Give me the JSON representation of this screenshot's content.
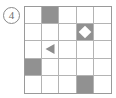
{
  "figure": {
    "item_number": "4",
    "item_number_style": "circled",
    "grid": {
      "rows": 5,
      "columns": 5,
      "border_color": "#9a9a9a",
      "line_color": "#b4b4b4",
      "cell_background": "#ffffff",
      "fill_color": "#919191",
      "cells": [
        [
          {
            "fill": "none",
            "mark": "none"
          },
          {
            "fill": "gray",
            "mark": "none"
          },
          {
            "fill": "none",
            "mark": "none"
          },
          {
            "fill": "none",
            "mark": "none"
          },
          {
            "fill": "none",
            "mark": "none"
          }
        ],
        [
          {
            "fill": "none",
            "mark": "none"
          },
          {
            "fill": "none",
            "mark": "none"
          },
          {
            "fill": "none",
            "mark": "none"
          },
          {
            "fill": "gray",
            "mark": "diamond-white"
          },
          {
            "fill": "none",
            "mark": "none"
          }
        ],
        [
          {
            "fill": "none",
            "mark": "none"
          },
          {
            "fill": "none",
            "mark": "triangle-left-gray"
          },
          {
            "fill": "none",
            "mark": "none"
          },
          {
            "fill": "none",
            "mark": "none"
          },
          {
            "fill": "none",
            "mark": "none"
          }
        ],
        [
          {
            "fill": "gray",
            "mark": "none"
          },
          {
            "fill": "none",
            "mark": "none"
          },
          {
            "fill": "none",
            "mark": "none"
          },
          {
            "fill": "none",
            "mark": "none"
          },
          {
            "fill": "none",
            "mark": "none"
          }
        ],
        [
          {
            "fill": "none",
            "mark": "none"
          },
          {
            "fill": "none",
            "mark": "none"
          },
          {
            "fill": "none",
            "mark": "none"
          },
          {
            "fill": "gray",
            "mark": "none"
          },
          {
            "fill": "none",
            "mark": "none"
          }
        ]
      ]
    }
  }
}
